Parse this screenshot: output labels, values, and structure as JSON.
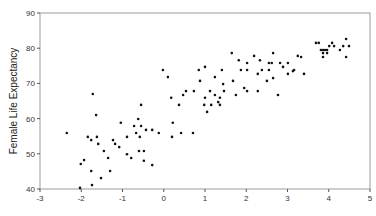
{
  "chart_data": {
    "type": "scatter",
    "title": "",
    "xlabel": "",
    "ylabel": "Female Life Expectancy",
    "xlim": [
      -3,
      5
    ],
    "ylim": [
      40,
      90
    ],
    "xticks": [
      -3,
      -2,
      -1,
      0,
      1,
      2,
      3,
      4,
      5
    ],
    "yticks": [
      40,
      50,
      60,
      70,
      80,
      90
    ],
    "grid": false,
    "legend": null,
    "marker_color": "#111111",
    "axis_color": "#888888",
    "points": [
      [
        -2.35,
        55.9
      ],
      [
        -2.01,
        47.1
      ],
      [
        -1.93,
        48.2
      ],
      [
        -1.84,
        54.8
      ],
      [
        -1.76,
        53.9
      ],
      [
        -1.62,
        54.8
      ],
      [
        -1.59,
        52.8
      ],
      [
        -1.72,
        67.0
      ],
      [
        -1.64,
        61.0
      ],
      [
        -1.76,
        45.1
      ],
      [
        -1.74,
        41.1
      ],
      [
        -1.52,
        43.1
      ],
      [
        -1.45,
        50.8
      ],
      [
        -1.35,
        48.8
      ],
      [
        -1.3,
        45.1
      ],
      [
        -1.23,
        53.9
      ],
      [
        -1.18,
        52.8
      ],
      [
        -1.08,
        51.9
      ],
      [
        -1.04,
        58.8
      ],
      [
        -0.89,
        54.8
      ],
      [
        -0.89,
        49.9
      ],
      [
        -0.79,
        48.8
      ],
      [
        -0.72,
        57.9
      ],
      [
        -0.67,
        55.9
      ],
      [
        -0.62,
        59.9
      ],
      [
        -0.58,
        54.8
      ],
      [
        -0.55,
        63.9
      ],
      [
        -0.55,
        57.9
      ],
      [
        -0.6,
        50.8
      ],
      [
        -0.48,
        50.8
      ],
      [
        -0.48,
        48.0
      ],
      [
        -0.43,
        56.8
      ],
      [
        -0.28,
        56.8
      ],
      [
        -0.12,
        55.9
      ],
      [
        -0.28,
        46.8
      ],
      [
        -0.02,
        73.8
      ],
      [
        0.1,
        71.8
      ],
      [
        0.22,
        58.8
      ],
      [
        0.2,
        54.8
      ],
      [
        0.18,
        65.9
      ],
      [
        0.37,
        63.9
      ],
      [
        0.42,
        55.9
      ],
      [
        0.47,
        66.7
      ],
      [
        0.54,
        67.8
      ],
      [
        0.71,
        55.9
      ],
      [
        0.73,
        67.8
      ],
      [
        0.85,
        73.8
      ],
      [
        0.88,
        70.7
      ],
      [
        0.98,
        63.9
      ],
      [
        1.0,
        74.7
      ],
      [
        1.0,
        65.9
      ],
      [
        1.05,
        61.9
      ],
      [
        1.12,
        67.8
      ],
      [
        1.15,
        63.9
      ],
      [
        1.24,
        71.8
      ],
      [
        1.24,
        66.7
      ],
      [
        1.32,
        64.7
      ],
      [
        1.36,
        65.9
      ],
      [
        1.36,
        63.9
      ],
      [
        1.41,
        73.8
      ],
      [
        1.44,
        69.8
      ],
      [
        1.46,
        67.8
      ],
      [
        1.65,
        78.6
      ],
      [
        1.68,
        70.7
      ],
      [
        1.75,
        66.7
      ],
      [
        1.82,
        76.6
      ],
      [
        1.87,
        73.8
      ],
      [
        1.95,
        68.7
      ],
      [
        2.02,
        75.8
      ],
      [
        2.02,
        73.8
      ],
      [
        2.02,
        67.8
      ],
      [
        2.19,
        77.8
      ],
      [
        2.28,
        72.7
      ],
      [
        2.28,
        67.8
      ],
      [
        2.33,
        76.6
      ],
      [
        2.38,
        73.8
      ],
      [
        2.5,
        70.7
      ],
      [
        2.55,
        75.8
      ],
      [
        2.55,
        73.8
      ],
      [
        2.62,
        75.8
      ],
      [
        2.65,
        78.6
      ],
      [
        2.65,
        71.5
      ],
      [
        2.77,
        66.7
      ],
      [
        2.82,
        75.8
      ],
      [
        2.89,
        74.7
      ],
      [
        3.01,
        75.8
      ],
      [
        3.01,
        72.7
      ],
      [
        3.13,
        73.5
      ],
      [
        3.16,
        73.8
      ],
      [
        3.25,
        77.8
      ],
      [
        3.33,
        77.5
      ],
      [
        3.4,
        72.7
      ],
      [
        3.69,
        81.5
      ],
      [
        3.76,
        81.5
      ],
      [
        3.81,
        79.5
      ],
      [
        3.86,
        79.5
      ],
      [
        3.91,
        79.5
      ],
      [
        3.96,
        79.5
      ],
      [
        3.86,
        78.6
      ],
      [
        3.96,
        78.6
      ],
      [
        3.86,
        77.5
      ],
      [
        4.01,
        80.6
      ],
      [
        4.08,
        81.5
      ],
      [
        4.13,
        80.6
      ],
      [
        4.27,
        79.5
      ],
      [
        4.35,
        80.6
      ],
      [
        4.42,
        82.6
      ],
      [
        4.49,
        80.6
      ],
      [
        4.42,
        77.5
      ],
      [
        -2.03,
        40.3
      ]
    ]
  }
}
